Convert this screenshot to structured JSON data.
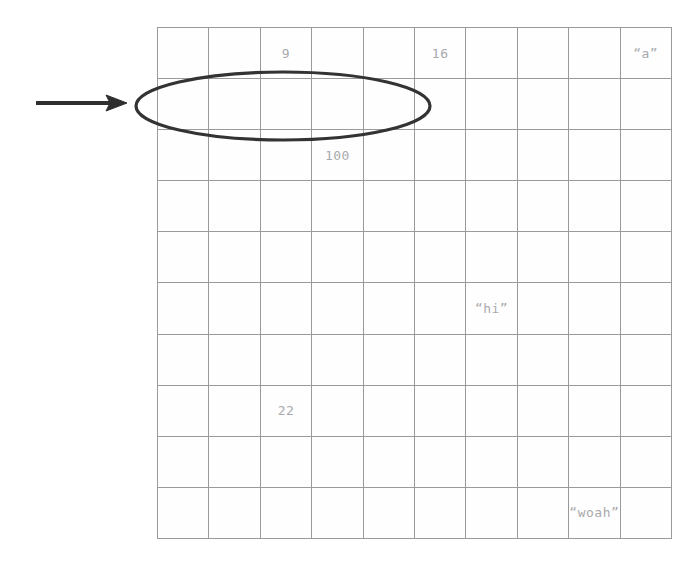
{
  "page": {
    "background_color": "#ffffff"
  },
  "grid": {
    "columns": 10,
    "rows": 10,
    "line_color": "#9a9a9c",
    "cell_text_color": "#a9a9ad",
    "cell_background": "#fefefe",
    "cells": [
      [
        "",
        "",
        "9",
        "",
        "",
        "16",
        "",
        "",
        "",
        "“a”"
      ],
      [
        "",
        "",
        "",
        "",
        "",
        "",
        "",
        "",
        "",
        ""
      ],
      [
        "",
        "",
        "",
        "100",
        "",
        "",
        "",
        "",
        "",
        ""
      ],
      [
        "",
        "",
        "",
        "",
        "",
        "",
        "",
        "",
        "",
        ""
      ],
      [
        "",
        "",
        "",
        "",
        "",
        "",
        "",
        "",
        "",
        ""
      ],
      [
        "",
        "",
        "",
        "",
        "",
        "",
        "“hi”",
        "",
        "",
        ""
      ],
      [
        "",
        "",
        "",
        "",
        "",
        "",
        "",
        "",
        "",
        ""
      ],
      [
        "",
        "",
        "22",
        "",
        "",
        "",
        "",
        "",
        "",
        ""
      ],
      [
        "",
        "",
        "",
        "",
        "",
        "",
        "",
        "",
        "",
        ""
      ],
      [
        "",
        "",
        "",
        "",
        "",
        "",
        "",
        "",
        "“woah”",
        ""
      ]
    ]
  },
  "annotations": {
    "arrow": {
      "name": "right-pointing-arrow",
      "color": "#2f2f2f",
      "start_x": 36,
      "end_x": 127,
      "y": 103
    },
    "ellipse": {
      "name": "hand-drawn-ellipse",
      "color": "#333333",
      "center_x": 283,
      "center_y": 106,
      "radius_x": 147,
      "radius_y": 34,
      "stroke_width": 3
    }
  }
}
